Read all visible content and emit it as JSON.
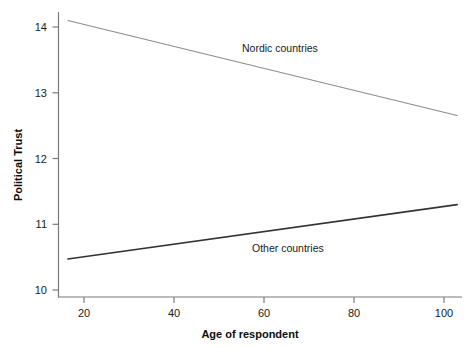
{
  "chart_data": {
    "type": "line",
    "title": "",
    "xlabel": "Age of respondent",
    "ylabel": "Political Trust",
    "xlim": [
      13.0,
      103.5
    ],
    "ylim": [
      9.85,
      14.2
    ],
    "xticks": [
      20,
      40,
      60,
      80,
      100
    ],
    "yticks": [
      10,
      11,
      12,
      13,
      14
    ],
    "grid": false,
    "legend_position": "inline-annotation",
    "series": [
      {
        "name": "Nordic countries",
        "x": [
          15.1,
          102.4
        ],
        "values": [
          14.07,
          12.62
        ],
        "color": "#8c8c8c",
        "width": 1.1,
        "label_x": 242,
        "label_y": 52
      },
      {
        "name": "Other countries",
        "x": [
          15.1,
          102.4
        ],
        "values": [
          10.43,
          11.26
        ],
        "color": "#333333",
        "width": 1.7,
        "label_x": 252,
        "label_y": 252
      }
    ]
  },
  "axes": {
    "x_tick_labels": [
      "20",
      "40",
      "60",
      "80",
      "100"
    ],
    "y_tick_labels": [
      "10",
      "11",
      "12",
      "13",
      "14"
    ],
    "x_axis_title": "Age of respondent",
    "y_axis_title": "Political Trust",
    "axis_color": "#7a7a7a"
  },
  "annotations": {
    "nordic_label": "Nordic countries",
    "other_label": "Other countries"
  }
}
